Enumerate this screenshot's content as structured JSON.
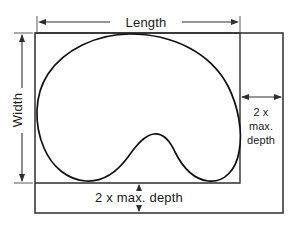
{
  "diagram": {
    "labels": {
      "length": "Length",
      "width": "Width",
      "depth_right_line1": "2 x",
      "depth_right_line2": "max.",
      "depth_right_line3": "depth",
      "depth_bottom": "2 x max. depth"
    },
    "colors": {
      "outline": "#111111",
      "frame": "#3a3a3a",
      "dimension": "#2e2e2e",
      "background": "#ffffff",
      "text": "#1a1a1a"
    },
    "geometry": {
      "outer_frame": {
        "x": 35,
        "y": 33,
        "width": 248,
        "height": 180
      },
      "inner_box": {
        "x": 35,
        "y": 33,
        "width": 205,
        "height": 150
      },
      "length_dim_y": 22,
      "length_dim_x1": 37,
      "length_dim_x2": 240,
      "width_dim_x": 22,
      "width_dim_y1": 33,
      "width_dim_y2": 183,
      "depth_right_dim_y": 97,
      "depth_right_x1": 240,
      "depth_right_x2": 283,
      "depth_bottom_dim_x": 139,
      "depth_bottom_y1": 183,
      "depth_bottom_y2": 213
    },
    "shape": {
      "name": "kidney-bean-outline",
      "path": "M 130 34 C 96 34 64 50 48 74 C 34 95 34 125 44 148 C 52 167 68 180 86 181 C 103 182 117 172 128 157 C 137 144 145 135 154 134 C 163 133 170 141 175 152 C 182 166 192 179 208 181 C 224 183 236 170 239 152 C 243 131 238 106 228 86 C 210 52 172 34 130 34 Z"
    }
  }
}
